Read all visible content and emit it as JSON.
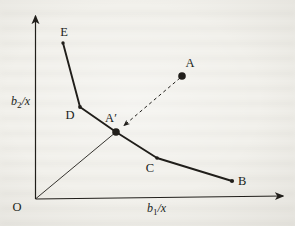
{
  "figure": {
    "colors": {
      "ink": "#201e1a",
      "paper": "#f2f1ec"
    },
    "axes": {
      "origin_label": "O",
      "y_label": {
        "base": "b",
        "sub": "2",
        "rest": "/x"
      },
      "x_label": {
        "base": "b",
        "sub": "1",
        "rest": "/x"
      }
    },
    "points": {
      "E": {
        "label": "E"
      },
      "D": {
        "label": "D"
      },
      "Aprime": {
        "label": "A′"
      },
      "A": {
        "label": "A"
      },
      "C": {
        "label": "C"
      },
      "B": {
        "label": "B"
      }
    }
  }
}
